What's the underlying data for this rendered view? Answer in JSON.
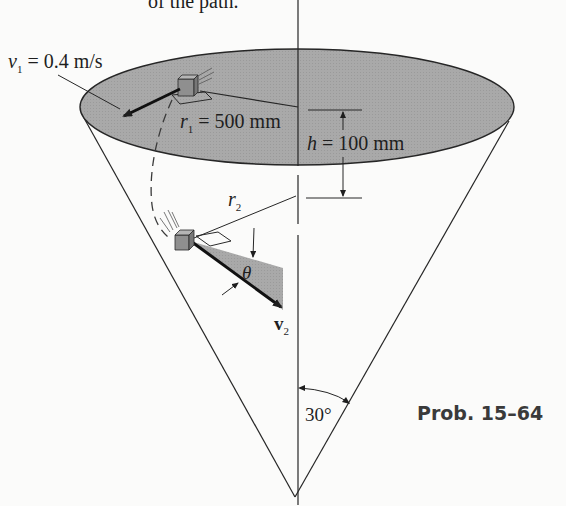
{
  "figure": {
    "top_text_fragment": "of the path.",
    "caption": "Prob. 15–64",
    "labels": {
      "v1": {
        "symbol": "v",
        "subscript": "1",
        "value": " = 0.4 m/s"
      },
      "r1": {
        "symbol": "r",
        "subscript": "1",
        "value": " = 500 mm"
      },
      "h": {
        "symbol": "h",
        "value": " = 100 mm"
      },
      "r2": {
        "symbol": "r",
        "subscript": "2"
      },
      "theta": {
        "symbol": "θ"
      },
      "v2": {
        "symbol": "v",
        "subscript": "2"
      },
      "angle": {
        "value": "30°"
      }
    },
    "colors": {
      "surface_fill": "#a9a9a9",
      "line": "#262626",
      "block": "#8f8f8f",
      "background": "#fbfbfa"
    }
  }
}
